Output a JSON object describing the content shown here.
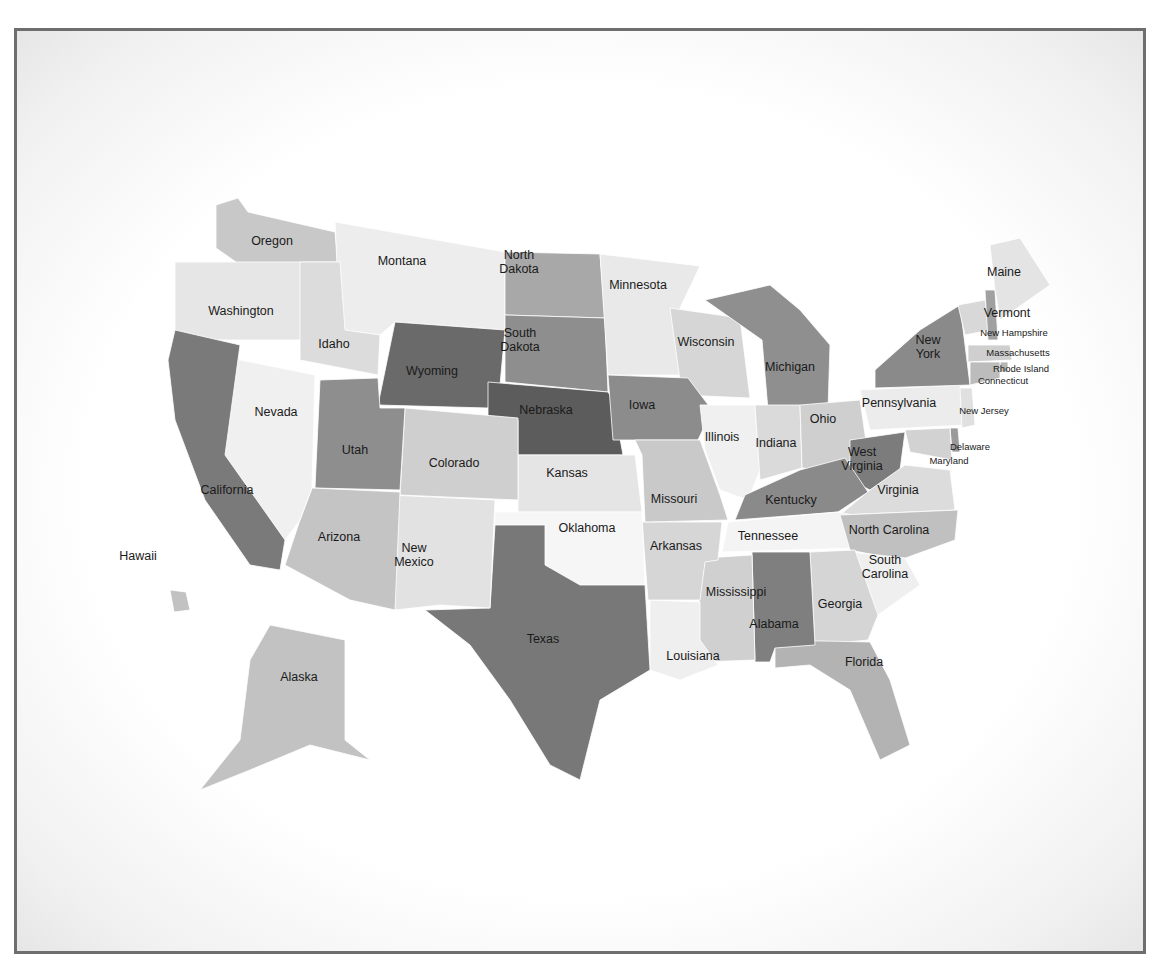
{
  "map": {
    "title": "United States choropleth map",
    "frame_color": "#6e6e6e",
    "states": [
      {
        "name": "Washington",
        "label": "Washington",
        "shade": "#e6e6e6",
        "lx": 241,
        "ly": 311,
        "pts": "175,262 236,262 236,232 335,262 340,340 175,340"
      },
      {
        "name": "Oregon",
        "label": "Oregon",
        "shade": "#c8c8c8",
        "lx": 272,
        "ly": 241,
        "pts": "216,205 238,198 248,212 335,232 338,262 236,262 216,248"
      },
      {
        "name": "Montana",
        "label": "Montana",
        "shade": "#ededed",
        "lx": 402,
        "ly": 261,
        "pts": "335,222 505,252 505,330 395,322 380,335 340,330"
      },
      {
        "name": "Idaho",
        "label": "Idaho",
        "shade": "#dcdcdc",
        "lx": 334,
        "ly": 344,
        "pts": "300,262 340,262 345,330 380,335 378,375 300,360"
      },
      {
        "name": "Wyoming",
        "label": "Wyoming",
        "shade": "#6a6a6a",
        "lx": 432,
        "ly": 371,
        "pts": "395,322 505,330 500,385 488,408 378,405"
      },
      {
        "name": "North Dakota",
        "label": "North\nDakota",
        "shade": "#a8a8a8",
        "lx": 519,
        "ly": 265,
        "pts": "505,252 600,254 605,318 505,315"
      },
      {
        "name": "South Dakota",
        "label": "South\nDakota",
        "shade": "#8e8e8e",
        "lx": 520,
        "ly": 343,
        "pts": "505,315 605,318 608,392 505,382"
      },
      {
        "name": "Nebraska",
        "label": "Nebraska",
        "shade": "#5c5c5c",
        "lx": 546,
        "ly": 410,
        "pts": "488,382 608,392 613,400 623,455 518,455 518,420 488,418"
      },
      {
        "name": "Minnesota",
        "label": "Minnesota",
        "shade": "#e9e9e9",
        "lx": 638,
        "ly": 285,
        "pts": "600,254 700,266 680,308 682,375 608,375"
      },
      {
        "name": "Wisconsin",
        "label": "Wisconsin",
        "shade": "#d6d6d6",
        "lx": 706,
        "ly": 342,
        "pts": "670,308 740,318 750,398 682,395"
      },
      {
        "name": "Iowa",
        "label": "Iowa",
        "shade": "#8c8c8c",
        "lx": 642,
        "ly": 405,
        "pts": "608,375 688,378 712,410 698,440 613,440"
      },
      {
        "name": "Michigan",
        "label": "Michigan",
        "shade": "#8f8f8f",
        "lx": 790,
        "ly": 367,
        "pts": "705,300 770,285 800,310 830,345 828,410 768,410 762,340"
      },
      {
        "name": "Illinois",
        "label": "Illinois",
        "shade": "#f0f0f0",
        "lx": 722,
        "ly": 437,
        "pts": "700,405 755,405 760,470 748,500 720,490 705,450"
      },
      {
        "name": "Indiana",
        "label": "Indiana",
        "shade": "#dadada",
        "lx": 776,
        "ly": 443,
        "pts": "755,405 800,405 802,468 760,480"
      },
      {
        "name": "Ohio",
        "label": "Ohio",
        "shade": "#cfcfcf",
        "lx": 823,
        "ly": 419,
        "pts": "800,405 860,400 868,455 820,470 802,468"
      },
      {
        "name": "Pennsylvania",
        "label": "Pennsylvania",
        "shade": "#ececec",
        "lx": 899,
        "ly": 403,
        "pts": "860,390 960,385 965,425 870,430"
      },
      {
        "name": "New York",
        "label": "New\nYork",
        "shade": "#8a8a8a",
        "lx": 928,
        "ly": 350,
        "pts": "875,370 920,330 960,305 970,385 875,388"
      },
      {
        "name": "Vermont",
        "label": "Vermont",
        "shade": "#d8d8d8",
        "lx": 1007,
        "ly": 313,
        "pts": "958,305 985,300 990,330 965,335"
      },
      {
        "name": "New Hampshire",
        "label": "New Hampshire",
        "shade": "#a0a0a0",
        "lx": 1014,
        "ly": 333,
        "pts": "985,290 995,290 998,340 988,340"
      },
      {
        "name": "Maine",
        "label": "Maine",
        "shade": "#e4e4e4",
        "lx": 1004,
        "ly": 272,
        "pts": "990,245 1020,238 1050,285 1000,320 995,290"
      },
      {
        "name": "Massachusetts",
        "label": "Massachusetts",
        "shade": "#cfcfcf",
        "lx": 1018,
        "ly": 353,
        "pts": "968,345 1010,345 1012,360 968,362"
      },
      {
        "name": "Rhode Island",
        "label": "Rhode Island",
        "shade": "#b5b5b5",
        "lx": 1021,
        "ly": 369,
        "pts": "1000,362 1008,362 1008,372 1000,372"
      },
      {
        "name": "Connecticut",
        "label": "Connecticut",
        "shade": "#bcbcbc",
        "lx": 1003,
        "ly": 381,
        "pts": "970,362 1000,362 1000,378 970,385"
      },
      {
        "name": "New Jersey",
        "label": "New Jersey",
        "shade": "#e0e0e0",
        "lx": 984,
        "ly": 411,
        "pts": "960,388 972,388 975,425 962,428"
      },
      {
        "name": "Delaware",
        "label": "Delaware",
        "shade": "#9a9a9a",
        "lx": 970,
        "ly": 447,
        "pts": "950,428 958,428 960,452 952,452"
      },
      {
        "name": "Maryland",
        "label": "Maryland",
        "shade": "#d2d2d2",
        "lx": 949,
        "ly": 461,
        "pts": "905,430 950,428 952,460 910,452"
      },
      {
        "name": "West Virginia",
        "label": "West\nVirginia",
        "shade": "#7c7c7c",
        "lx": 862,
        "ly": 462,
        "pts": "850,440 905,432 900,470 870,490 850,480"
      },
      {
        "name": "Virginia",
        "label": "Virginia",
        "shade": "#dcdcdc",
        "lx": 898,
        "ly": 490,
        "pts": "870,490 905,465 950,470 955,510 840,515"
      },
      {
        "name": "Kentucky",
        "label": "Kentucky",
        "shade": "#8a8a8a",
        "lx": 791,
        "ly": 500,
        "pts": "745,495 800,470 845,458 868,492 838,512 735,520"
      },
      {
        "name": "Tennessee",
        "label": "Tennessee",
        "shade": "#f4f4f4",
        "lx": 768,
        "ly": 536,
        "pts": "728,522 838,512 880,520 860,548 722,552"
      },
      {
        "name": "North Carolina",
        "label": "North Carolina",
        "shade": "#c0c0c0",
        "lx": 889,
        "ly": 530,
        "pts": "840,515 958,510 955,540 900,560 850,550"
      },
      {
        "name": "South Carolina",
        "label": "South\nCarolina",
        "shade": "#efefef",
        "lx": 885,
        "ly": 570,
        "pts": "850,552 905,558 920,585 878,615 855,585"
      },
      {
        "name": "Georgia",
        "label": "Georgia",
        "shade": "#d5d5d5",
        "lx": 840,
        "ly": 604,
        "pts": "810,552 855,550 878,615 868,640 815,645"
      },
      {
        "name": "Florida",
        "label": "Florida",
        "shade": "#b3b3b3",
        "lx": 864,
        "ly": 662,
        "pts": "775,640 870,642 890,680 910,745 880,760 850,690 810,665 775,668"
      },
      {
        "name": "Alabama",
        "label": "Alabama",
        "shade": "#7f7f7f",
        "lx": 774,
        "ly": 624,
        "pts": "752,552 810,552 815,645 775,648 770,662 755,662"
      },
      {
        "name": "Mississippi",
        "label": "Mississippi",
        "shade": "#d0d0d0",
        "lx": 736,
        "ly": 592,
        "pts": "705,558 752,555 755,660 700,662 695,630"
      },
      {
        "name": "Louisiana",
        "label": "Louisiana",
        "shade": "#efefef",
        "lx": 693,
        "ly": 656,
        "pts": "650,600 700,602 700,640 718,665 680,680 650,670"
      },
      {
        "name": "Arkansas",
        "label": "Arkansas",
        "shade": "#d6d6d6",
        "lx": 676,
        "ly": 546,
        "pts": "642,522 722,522 718,560 705,562 700,600 648,600"
      },
      {
        "name": "Missouri",
        "label": "Missouri",
        "shade": "#c9c9c9",
        "lx": 674,
        "ly": 499,
        "pts": "635,440 700,440 720,495 728,520 645,522 642,455"
      },
      {
        "name": "Kansas",
        "label": "Kansas",
        "shade": "#e5e5e5",
        "lx": 567,
        "ly": 473,
        "pts": "518,455 635,455 642,512 518,512"
      },
      {
        "name": "Oklahoma",
        "label": "Oklahoma",
        "shade": "#f6f6f6",
        "lx": 587,
        "ly": 528,
        "pts": "495,512 642,512 645,585 580,585 545,565 545,525 495,525"
      },
      {
        "name": "Texas",
        "label": "Texas",
        "shade": "#787878",
        "lx": 543,
        "ly": 639,
        "pts": "495,525 545,525 545,565 580,585 645,585 650,670 600,700 580,780 550,765 510,700 470,645 425,610 490,608"
      },
      {
        "name": "New Mexico",
        "label": "New\nMexico",
        "shade": "#e2e2e2",
        "lx": 414,
        "ly": 558,
        "pts": "390,495 495,500 490,608 440,605 395,610"
      },
      {
        "name": "Colorado",
        "label": "Colorado",
        "shade": "#cfcfcf",
        "lx": 454,
        "ly": 463,
        "pts": "405,408 518,418 518,500 400,495"
      },
      {
        "name": "Utah",
        "label": "Utah",
        "shade": "#8e8e8e",
        "lx": 355,
        "ly": 450,
        "pts": "320,380 378,378 380,408 405,408 400,490 315,488"
      },
      {
        "name": "Arizona",
        "label": "Arizona",
        "shade": "#c4c4c4",
        "lx": 339,
        "ly": 537,
        "pts": "312,488 400,492 395,610 350,600 285,565 300,520"
      },
      {
        "name": "Nevada",
        "label": "Nevada",
        "shade": "#f0f0f0",
        "lx": 276,
        "ly": 412,
        "pts": "215,355 315,375 312,488 300,520 285,540 225,455"
      },
      {
        "name": "California",
        "label": "California",
        "shade": "#7a7a7a",
        "lx": 227,
        "ly": 490,
        "pts": "175,330 240,345 225,455 285,540 280,570 250,565 205,500 175,420 168,360"
      },
      {
        "name": "Alaska",
        "label": "Alaska",
        "shade": "#c2c2c2",
        "lx": 299,
        "ly": 677,
        "pts": "270,625 345,640 345,740 370,760 310,745 250,770 200,790 240,740 245,700 250,660"
      },
      {
        "name": "Hawaii",
        "label": "Hawaii",
        "shade": "#c2c2c2",
        "lx": 138,
        "ly": 556,
        "pts": "170,590 186,592 190,610 174,612"
      }
    ]
  }
}
